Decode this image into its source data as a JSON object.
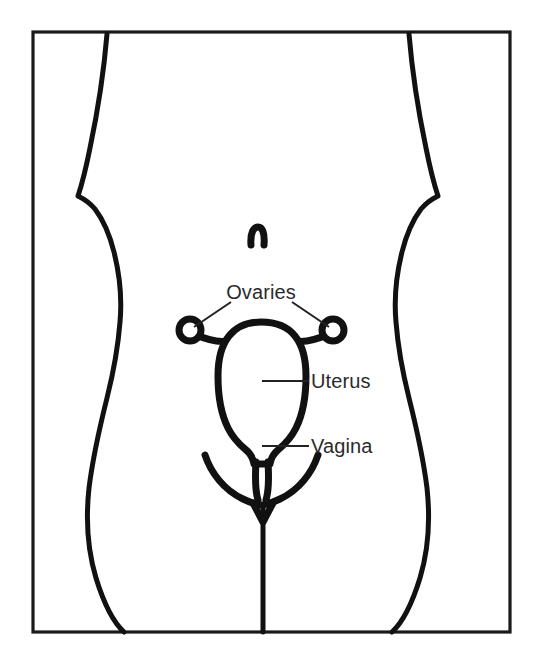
{
  "figure": {
    "kind": "anatomical-line-diagram",
    "view": "frontal torso silhouette with internal organs overlaid",
    "background_color": "#ffffff",
    "line_color": "#111111",
    "frame_color": "#1a1a1a",
    "label_color": "#2b2b2b"
  },
  "labels": {
    "ovaries": "Ovaries",
    "uterus": "Uterus",
    "vagina": "Vagina"
  },
  "parts": [
    {
      "name": "torso-silhouette",
      "label": ""
    },
    {
      "name": "navel",
      "label": ""
    },
    {
      "name": "ovary-left",
      "label": "Ovaries"
    },
    {
      "name": "ovary-right",
      "label": "Ovaries"
    },
    {
      "name": "fallopian-tubes",
      "label": ""
    },
    {
      "name": "uterus",
      "label": "Uterus"
    },
    {
      "name": "cervix",
      "label": ""
    },
    {
      "name": "vagina",
      "label": "Vagina"
    },
    {
      "name": "labia",
      "label": ""
    }
  ],
  "geometry": {
    "frame": {
      "x": 33,
      "y": 32,
      "width": 477,
      "height": 600
    },
    "ovary_left_center": [
      190,
      330
    ],
    "ovary_right_center": [
      333,
      330
    ],
    "ovary_radius": 11,
    "uterus_bounds": [
      218,
      330,
      305,
      442
    ],
    "navel_center": [
      257,
      237
    ]
  }
}
